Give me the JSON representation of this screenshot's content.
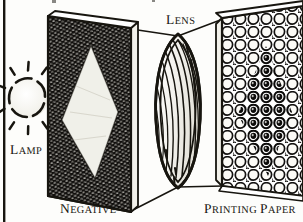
{
  "figure": {
    "type": "line-art-diagram",
    "width": 303,
    "height": 222,
    "style": "pen-and-ink engraving hatching",
    "background_color": "#fdfdfb",
    "ink_color": "#17150f"
  },
  "labels": {
    "lamp": {
      "first": "L",
      "rest": "AMP"
    },
    "lens": {
      "first": "L",
      "rest": "ENS"
    },
    "negative": {
      "first": "N",
      "rest": "EGATIVE"
    },
    "printing_paper": {
      "first": "P",
      "rest": "RINTING ",
      "second": "P",
      "second_rest": "APER"
    }
  },
  "components": [
    {
      "name": "lamp",
      "label": "LAMP",
      "shape": "dashed-circle-with-rays",
      "description": "light source drawn as broken circle outline with radiating tick marks",
      "center_x": 28,
      "center_y": 98,
      "radius": 20,
      "ray_count": 11
    },
    {
      "name": "negative",
      "label": "NEGATIVE",
      "shape": "parallelogram-panel",
      "description": "dark cross-hatched sheet in perspective with a pale diamond image area",
      "fill": "#141210",
      "image_area": "light diamond / kite"
    },
    {
      "name": "lens",
      "label": "LENS",
      "shape": "biconvex-ellipse",
      "description": "upright lens element with diagonal curvature hatching",
      "center_x": 178,
      "center_y": 108
    },
    {
      "name": "printing_paper",
      "label": "PRINTING PAPER",
      "shape": "parallelogram-panel",
      "description": "sheet in perspective filled with grain cells; central diamond of grains darkened by exposure",
      "fill": "#ffffff",
      "image_area": "dark diamond of exposed grains"
    }
  ],
  "light_rays": {
    "count": 4,
    "description": "thin straight lines from negative corners to lens and from lens to printing paper"
  },
  "rules": {
    "left_margin_rule": "vertical black column rule at left edge"
  }
}
